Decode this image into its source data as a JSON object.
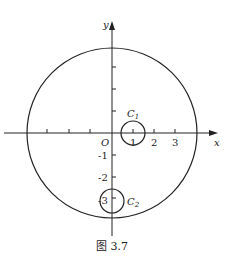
{
  "figure": {
    "caption": "图 3.7",
    "axes": {
      "x_label": "x",
      "y_label": "y",
      "origin_label": "O",
      "x_tick_labels": [
        "1",
        "2",
        "3"
      ],
      "y_tick_labels": [
        "-1",
        "-2",
        "-3"
      ]
    },
    "circles": [
      {
        "name": "big",
        "label": "",
        "center": [
          0,
          0
        ],
        "radius": 4
      },
      {
        "name": "C1",
        "label": "C",
        "subscript": "1",
        "center": [
          1,
          0
        ],
        "radius": 0.55
      },
      {
        "name": "C2",
        "label": "C",
        "subscript": "2",
        "center": [
          0,
          -3
        ],
        "radius": 0.55
      }
    ],
    "stroke_color": "#222222"
  }
}
